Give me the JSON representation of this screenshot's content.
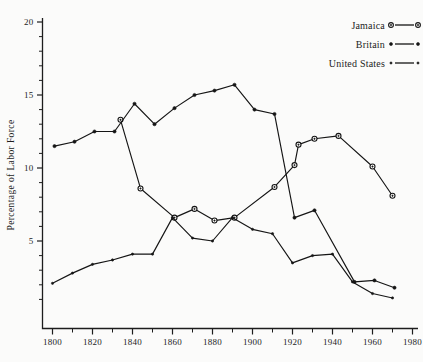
{
  "chart_data": {
    "type": "line",
    "title": "",
    "xlabel": "",
    "ylabel": "Percentage of Labor Force",
    "xlim": [
      1795,
      1985
    ],
    "ylim": [
      0,
      21
    ],
    "grid": false,
    "legend_position": "top-right",
    "y_ticks_major": [
      5,
      10,
      15,
      20
    ],
    "y_tick_labels": [
      "5",
      "10",
      "15",
      "20"
    ],
    "y_ticks_minor": [
      1,
      2,
      3,
      4,
      6,
      7,
      8,
      9,
      11,
      12,
      13,
      14,
      16,
      17,
      18,
      19
    ],
    "x_ticks_major": [
      1800,
      1820,
      1840,
      1860,
      1880,
      1900,
      1920,
      1940,
      1960,
      1980
    ],
    "x_tick_labels": [
      "1800",
      "1820",
      "1840",
      "1860",
      "1880",
      "1900",
      "1920",
      "1940",
      "1960",
      "1980"
    ],
    "x_ticks_minor": [
      1810,
      1830,
      1850,
      1870,
      1890,
      1910,
      1930,
      1950,
      1970
    ],
    "series": [
      {
        "name": "Jamaica",
        "marker": "open-circle",
        "x": [
          1834,
          1844,
          1861,
          1871,
          1881,
          1891,
          1911,
          1921,
          1923,
          1931,
          1943,
          1960,
          1970
        ],
        "y": [
          13.3,
          8.6,
          6.6,
          7.2,
          6.4,
          6.6,
          8.7,
          10.2,
          11.6,
          12.0,
          12.2,
          10.1,
          8.1
        ]
      },
      {
        "name": "Britain",
        "marker": "dot",
        "x": [
          1801,
          1811,
          1821,
          1831,
          1841,
          1851,
          1861,
          1871,
          1881,
          1891,
          1901,
          1911,
          1921,
          1931,
          1951,
          1961,
          1971
        ],
        "y": [
          11.5,
          11.8,
          12.5,
          12.5,
          14.4,
          13.0,
          14.1,
          15.0,
          15.3,
          15.7,
          14.0,
          13.7,
          6.6,
          7.1,
          2.2,
          2.3,
          1.8
        ]
      },
      {
        "name": "United States",
        "marker": "small-dot",
        "x": [
          1800,
          1810,
          1820,
          1830,
          1840,
          1850,
          1860,
          1870,
          1880,
          1890,
          1900,
          1910,
          1920,
          1930,
          1940,
          1950,
          1960,
          1970
        ],
        "y": [
          2.1,
          2.8,
          3.4,
          3.7,
          4.1,
          4.1,
          6.6,
          5.2,
          5.0,
          6.6,
          5.8,
          5.5,
          3.5,
          4.0,
          4.1,
          2.2,
          1.4,
          1.1
        ]
      }
    ]
  },
  "legend": {
    "entries": [
      {
        "label": "Jamaica",
        "marker": "open-circle"
      },
      {
        "label": "Britain",
        "marker": "dot"
      },
      {
        "label": "United States",
        "marker": "small-dot"
      }
    ]
  },
  "colors": {
    "ink": "#151515",
    "paper": "#fbfbfa"
  }
}
